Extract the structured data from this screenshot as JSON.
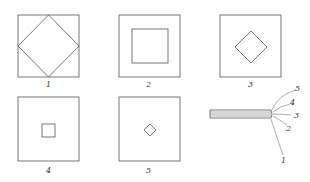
{
  "figure": {
    "colors": {
      "line": "#555555",
      "label": "#333333",
      "background": "#ffffff"
    },
    "panels": [
      {
        "id": "panel-1",
        "label": "1",
        "outer": "square",
        "inner": "diamond",
        "inner_size": "touching outer edges"
      },
      {
        "id": "panel-2",
        "label": "2",
        "outer": "square",
        "inner": "square",
        "inner_size": "large"
      },
      {
        "id": "panel-3",
        "label": "3",
        "outer": "square",
        "inner": "diamond",
        "inner_size": "medium"
      },
      {
        "id": "panel-4",
        "label": "4",
        "outer": "square",
        "inner": "square",
        "inner_size": "small"
      },
      {
        "id": "panel-5",
        "label": "5",
        "outer": "square",
        "inner": "diamond",
        "inner_size": "very small"
      }
    ],
    "bundle": {
      "description": "stacked layers with fanned leader lines",
      "leader_labels": [
        "5",
        "4",
        "3",
        "2",
        "1"
      ]
    }
  }
}
